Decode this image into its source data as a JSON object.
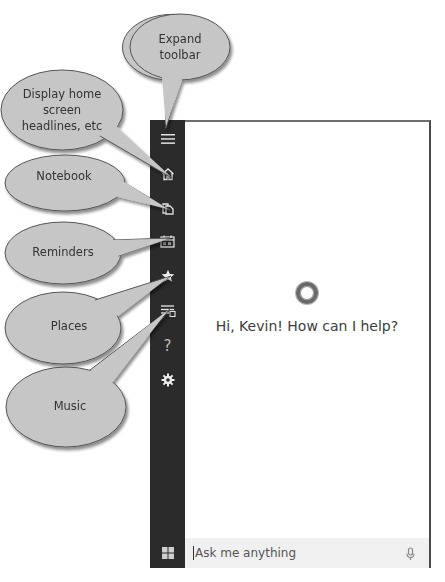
{
  "sidebar": {
    "items": [
      {
        "name": "expand-toolbar",
        "icon": "hamburger-icon"
      },
      {
        "name": "home",
        "icon": "home-icon"
      },
      {
        "name": "notebook",
        "icon": "notebook-icon"
      },
      {
        "name": "reminders",
        "icon": "reminders-icon"
      },
      {
        "name": "places",
        "icon": "star-icon"
      },
      {
        "name": "music",
        "icon": "music-list-icon"
      },
      {
        "name": "help",
        "icon": "question-icon",
        "glyph": "?"
      },
      {
        "name": "settings",
        "icon": "gear-icon"
      }
    ],
    "start_icon": "windows-logo-icon"
  },
  "main": {
    "greeting": "Hi, Kevin! How can I help?",
    "logo_icon": "cortana-ring-icon"
  },
  "search": {
    "placeholder": "Ask me anything",
    "mic_icon": "microphone-icon"
  },
  "callouts": {
    "expand_toolbar": [
      "Expand",
      "toolbar"
    ],
    "home": [
      "Display home",
      "screen",
      "headlines, etc"
    ],
    "notebook": [
      "Notebook"
    ],
    "reminders": [
      "Reminders"
    ],
    "places": [
      "Places"
    ],
    "music": [
      "Music"
    ]
  },
  "colors": {
    "sidebar_bg": "#2b2b2b",
    "bubble_fill": "#c6c6c6",
    "bubble_stroke": "#555555",
    "search_bg": "#f0f0f0"
  }
}
